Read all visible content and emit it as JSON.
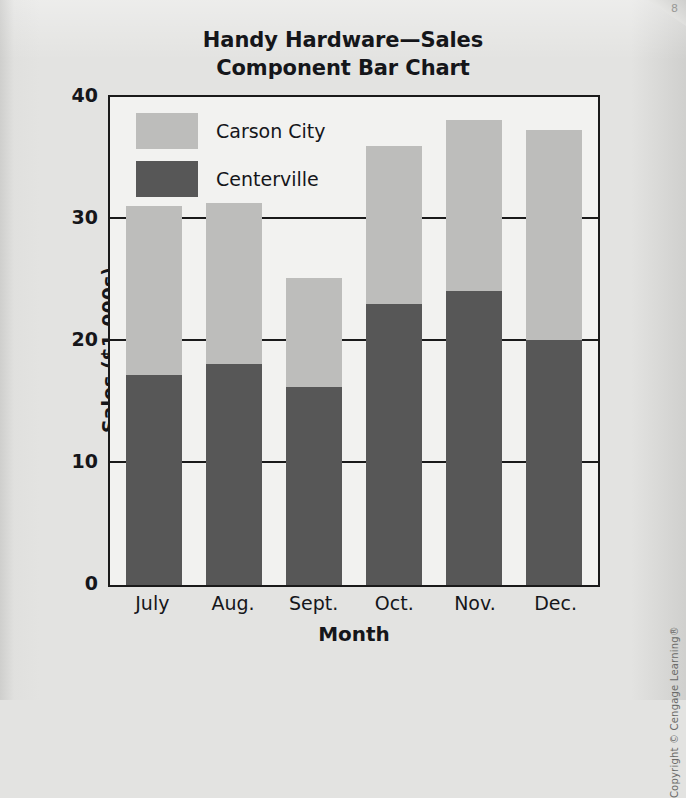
{
  "chart_data": {
    "type": "bar",
    "subtype": "stacked-component-bar",
    "title": "Handy Hardware—Sales",
    "subtitle": "Component Bar Chart",
    "title_lines": [
      "Handy Hardware—Sales",
      "Component Bar Chart"
    ],
    "xlabel": "Month",
    "ylabel": "Sales ($1,000s)",
    "categories": [
      "July",
      "Aug.",
      "Sept.",
      "Oct.",
      "Nov.",
      "Dec."
    ],
    "series": [
      {
        "name": "Centerville",
        "values": [
          17.2,
          18.1,
          16.2,
          23.0,
          24.1,
          20.1
        ],
        "color": "#575757"
      },
      {
        "name": "Carson City",
        "values": [
          13.9,
          13.2,
          9.0,
          13.0,
          14.0,
          17.2
        ],
        "color": "#bdbdbb"
      }
    ],
    "totals": [
      31.1,
      31.3,
      25.2,
      36.0,
      38.1,
      37.3
    ],
    "ylim": [
      0,
      40
    ],
    "yticks": [
      "0",
      "10",
      "20",
      "30",
      "40"
    ],
    "ytick_values": [
      0,
      10,
      20,
      30,
      40
    ],
    "grid": true,
    "legend_position": "top-left-inside",
    "stack_order_bottom_to_top": [
      "Centerville",
      "Carson City"
    ]
  },
  "legend": {
    "items": [
      {
        "label": "Carson City",
        "swatch": "carson"
      },
      {
        "label": "Centerville",
        "swatch": "center"
      }
    ]
  },
  "footer": {
    "copyright": "Copyright © Cengage Learning®",
    "page_marker": "8"
  }
}
